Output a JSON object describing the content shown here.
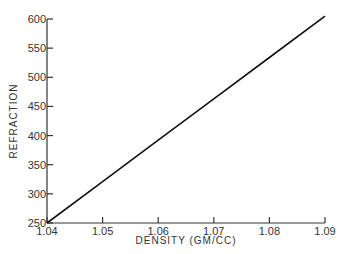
{
  "chart_data": {
    "type": "line",
    "title": "",
    "xlabel": "DENSITY (GM/CC)",
    "ylabel": "REFRACTION",
    "xlim": [
      1.04,
      1.09
    ],
    "ylim": [
      250,
      600
    ],
    "x_ticks": [
      "1.04",
      "1.05",
      "1.06",
      "1.07",
      "1.08",
      "1.09"
    ],
    "y_ticks": [
      "250",
      "300",
      "350",
      "400",
      "450",
      "500",
      "550",
      "600"
    ],
    "grid": false,
    "legend": null,
    "series": [
      {
        "name": "Refraction vs Density",
        "x": [
          1.04,
          1.05,
          1.06,
          1.07,
          1.08,
          1.09
        ],
        "y": [
          250,
          321,
          392,
          463,
          534,
          605
        ],
        "color": "#111111"
      }
    ]
  }
}
